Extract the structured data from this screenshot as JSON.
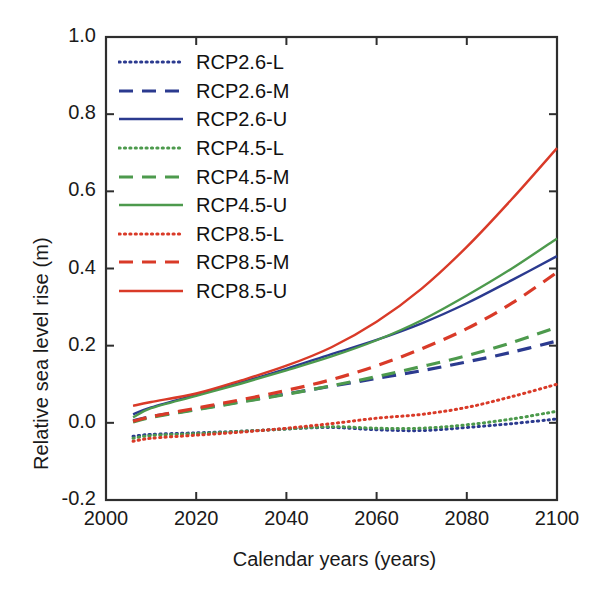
{
  "chart_data": {
    "type": "line",
    "title": "",
    "xlabel": "Calendar years (years)",
    "ylabel": "Relative sea level rise (m)",
    "xlim": [
      2000,
      2100
    ],
    "ylim": [
      -0.2,
      1.0
    ],
    "xticks": [
      2000,
      2020,
      2040,
      2060,
      2080,
      2100
    ],
    "xtick_labels": [
      "2000",
      "2020",
      "2040",
      "2060",
      "2080",
      "2100"
    ],
    "yticks": [
      -0.2,
      0.0,
      0.2,
      0.4,
      0.6,
      0.8,
      1.0
    ],
    "ytick_labels": [
      "-0.2",
      "0.0",
      "0.2",
      "0.4",
      "0.6",
      "0.8",
      "1.0"
    ],
    "grid": false,
    "legend_position": "upper left",
    "x": [
      2006,
      2010,
      2020,
      2030,
      2040,
      2050,
      2060,
      2070,
      2080,
      2090,
      2100
    ],
    "series": [
      {
        "name": "RCP2.6-L",
        "color": "#2b3a8f",
        "style": "dotted",
        "values": [
          -0.035,
          -0.03,
          -0.026,
          -0.022,
          -0.016,
          -0.012,
          -0.018,
          -0.02,
          -0.012,
          -0.002,
          0.01
        ]
      },
      {
        "name": "RCP2.6-M",
        "color": "#2b3a8f",
        "style": "dashed",
        "values": [
          0.005,
          0.016,
          0.035,
          0.055,
          0.075,
          0.095,
          0.115,
          0.135,
          0.158,
          0.183,
          0.212
        ]
      },
      {
        "name": "RCP2.6-U",
        "color": "#2b3a8f",
        "style": "solid",
        "values": [
          0.022,
          0.04,
          0.073,
          0.105,
          0.14,
          0.178,
          0.215,
          0.258,
          0.31,
          0.37,
          0.432
        ]
      },
      {
        "name": "RCP4.5-L",
        "color": "#4d9a4d",
        "style": "dotted",
        "values": [
          -0.04,
          -0.033,
          -0.028,
          -0.022,
          -0.016,
          -0.01,
          -0.014,
          -0.014,
          -0.005,
          0.01,
          0.03
        ]
      },
      {
        "name": "RCP4.5-M",
        "color": "#4d9a4d",
        "style": "dashed",
        "values": [
          0.002,
          0.014,
          0.034,
          0.054,
          0.074,
          0.096,
          0.12,
          0.146,
          0.174,
          0.208,
          0.248
        ]
      },
      {
        "name": "RCP4.5-U",
        "color": "#4d9a4d",
        "style": "solid",
        "values": [
          0.014,
          0.038,
          0.07,
          0.102,
          0.136,
          0.172,
          0.214,
          0.266,
          0.33,
          0.4,
          0.478
        ]
      },
      {
        "name": "RCP8.5-L",
        "color": "#d93a28",
        "style": "dotted",
        "values": [
          -0.048,
          -0.04,
          -0.032,
          -0.024,
          -0.014,
          -0.002,
          0.012,
          0.022,
          0.04,
          0.068,
          0.1
        ]
      },
      {
        "name": "RCP8.5-M",
        "color": "#d93a28",
        "style": "dashed",
        "values": [
          0.004,
          0.016,
          0.038,
          0.06,
          0.084,
          0.112,
          0.148,
          0.192,
          0.244,
          0.31,
          0.39
        ]
      },
      {
        "name": "RCP8.5-U",
        "color": "#d93a28",
        "style": "solid",
        "values": [
          0.044,
          0.054,
          0.076,
          0.11,
          0.148,
          0.196,
          0.262,
          0.348,
          0.456,
          0.58,
          0.712
        ]
      }
    ],
    "legend_entries": [
      {
        "label": "RCP2.6-L",
        "color": "#2b3a8f",
        "style": "dotted"
      },
      {
        "label": "RCP2.6-M",
        "color": "#2b3a8f",
        "style": "dashed"
      },
      {
        "label": "RCP2.6-U",
        "color": "#2b3a8f",
        "style": "solid"
      },
      {
        "label": "RCP4.5-L",
        "color": "#4d9a4d",
        "style": "dotted"
      },
      {
        "label": "RCP4.5-M",
        "color": "#4d9a4d",
        "style": "dashed"
      },
      {
        "label": "RCP4.5-U",
        "color": "#4d9a4d",
        "style": "solid"
      },
      {
        "label": "RCP8.5-L",
        "color": "#d93a28",
        "style": "dotted"
      },
      {
        "label": "RCP8.5-M",
        "color": "#d93a28",
        "style": "dashed"
      },
      {
        "label": "RCP8.5-U",
        "color": "#d93a28",
        "style": "solid"
      }
    ]
  },
  "colors": {
    "rcp26": "#2b3a8f",
    "rcp45": "#4d9a4d",
    "rcp85": "#d93a28",
    "axis": "#2e2e2e",
    "background": "#ffffff"
  }
}
